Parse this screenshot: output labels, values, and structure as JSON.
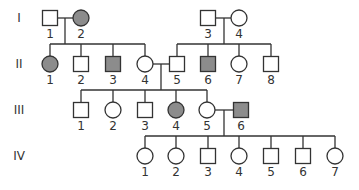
{
  "colors": {
    "affected": "#8c8c8c",
    "unaffected": "#ffffff",
    "stroke": "#333333"
  },
  "generations": [
    {
      "label": "I",
      "y": 18
    },
    {
      "label": "II",
      "y": 64
    },
    {
      "label": "III",
      "y": 110
    },
    {
      "label": "IV",
      "y": 156
    }
  ],
  "individuals": [
    {
      "id": "I-1",
      "gen": 0,
      "num": "1",
      "sex": "male",
      "affected": false,
      "x": 50
    },
    {
      "id": "I-2",
      "gen": 0,
      "num": "2",
      "sex": "female",
      "affected": true,
      "x": 81
    },
    {
      "id": "I-3",
      "gen": 0,
      "num": "3",
      "sex": "male",
      "affected": false,
      "x": 208
    },
    {
      "id": "I-4",
      "gen": 0,
      "num": "4",
      "sex": "female",
      "affected": false,
      "x": 239
    },
    {
      "id": "II-1",
      "gen": 1,
      "num": "1",
      "sex": "female",
      "affected": true,
      "x": 50
    },
    {
      "id": "II-2",
      "gen": 1,
      "num": "2",
      "sex": "male",
      "affected": false,
      "x": 81
    },
    {
      "id": "II-3",
      "gen": 1,
      "num": "3",
      "sex": "male",
      "affected": true,
      "x": 113
    },
    {
      "id": "II-4",
      "gen": 1,
      "num": "4",
      "sex": "female",
      "affected": false,
      "x": 145
    },
    {
      "id": "II-5",
      "gen": 1,
      "num": "5",
      "sex": "male",
      "affected": false,
      "x": 177
    },
    {
      "id": "II-6",
      "gen": 1,
      "num": "6",
      "sex": "male",
      "affected": true,
      "x": 208
    },
    {
      "id": "II-7",
      "gen": 1,
      "num": "7",
      "sex": "female",
      "affected": false,
      "x": 239
    },
    {
      "id": "II-8",
      "gen": 1,
      "num": "8",
      "sex": "male",
      "affected": false,
      "x": 271
    },
    {
      "id": "III-1",
      "gen": 2,
      "num": "1",
      "sex": "male",
      "affected": false,
      "x": 81
    },
    {
      "id": "III-2",
      "gen": 2,
      "num": "2",
      "sex": "female",
      "affected": false,
      "x": 113
    },
    {
      "id": "III-3",
      "gen": 2,
      "num": "3",
      "sex": "male",
      "affected": false,
      "x": 145
    },
    {
      "id": "III-4",
      "gen": 2,
      "num": "4",
      "sex": "female",
      "affected": true,
      "x": 176
    },
    {
      "id": "III-5",
      "gen": 2,
      "num": "5",
      "sex": "female",
      "affected": false,
      "x": 207
    },
    {
      "id": "III-6",
      "gen": 2,
      "num": "6",
      "sex": "male",
      "affected": true,
      "x": 241
    },
    {
      "id": "IV-1",
      "gen": 3,
      "num": "1",
      "sex": "female",
      "affected": false,
      "x": 145
    },
    {
      "id": "IV-2",
      "gen": 3,
      "num": "2",
      "sex": "female",
      "affected": false,
      "x": 176
    },
    {
      "id": "IV-3",
      "gen": 3,
      "num": "3",
      "sex": "male",
      "affected": false,
      "x": 208
    },
    {
      "id": "IV-4",
      "gen": 3,
      "num": "4",
      "sex": "female",
      "affected": false,
      "x": 239
    },
    {
      "id": "IV-5",
      "gen": 3,
      "num": "5",
      "sex": "male",
      "affected": false,
      "x": 271
    },
    {
      "id": "IV-6",
      "gen": 3,
      "num": "6",
      "sex": "male",
      "affected": false,
      "x": 303
    },
    {
      "id": "IV-7",
      "gen": 3,
      "num": "7",
      "sex": "female",
      "affected": false,
      "x": 335
    }
  ],
  "matings": [
    {
      "partners": [
        "I-1",
        "I-2"
      ],
      "children": [
        "II-1",
        "II-2",
        "II-3",
        "II-4"
      ],
      "descent_x": 65
    },
    {
      "partners": [
        "I-3",
        "I-4"
      ],
      "children": [
        "II-5",
        "II-6",
        "II-7",
        "II-8"
      ],
      "descent_x": 224
    },
    {
      "partners": [
        "II-4",
        "II-5"
      ],
      "children": [
        "III-1",
        "III-2",
        "III-3",
        "III-4",
        "III-5"
      ],
      "descent_x": 161
    },
    {
      "partners": [
        "III-5",
        "III-6"
      ],
      "children": [
        "IV-1",
        "IV-2",
        "IV-3",
        "IV-4",
        "IV-5",
        "IV-6",
        "IV-7"
      ],
      "descent_x": 224
    }
  ]
}
